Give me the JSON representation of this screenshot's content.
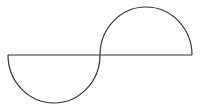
{
  "diagram": {
    "type": "s-curve-semicircles",
    "stroke_color": "#333333",
    "background_color": "#ffffff",
    "stroke_width": 1.2,
    "baseline": {
      "x1": 8,
      "y1": 55,
      "x2": 192,
      "y2": 55
    },
    "lower_semicircle": {
      "cx": 54,
      "cy": 55,
      "r": 46,
      "from_x": 8,
      "to_x": 100
    },
    "upper_semicircle": {
      "cx": 146,
      "cy": 55,
      "r": 46,
      "from_x": 100,
      "to_x": 192
    },
    "edge_mark": "|"
  }
}
